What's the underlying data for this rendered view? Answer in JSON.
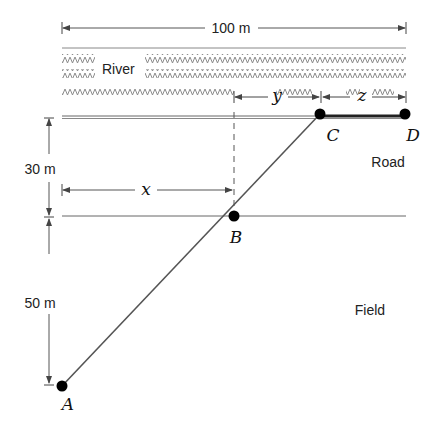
{
  "diagram": {
    "width_label": "100 m",
    "river_label": "River",
    "road_label": "Road",
    "field_label": "Field",
    "dim_30": "30 m",
    "dim_50": "50 m",
    "var_x": "x",
    "var_y": "y",
    "var_z": "z",
    "points": {
      "A": "A",
      "B": "B",
      "C": "C",
      "D": "D"
    }
  }
}
